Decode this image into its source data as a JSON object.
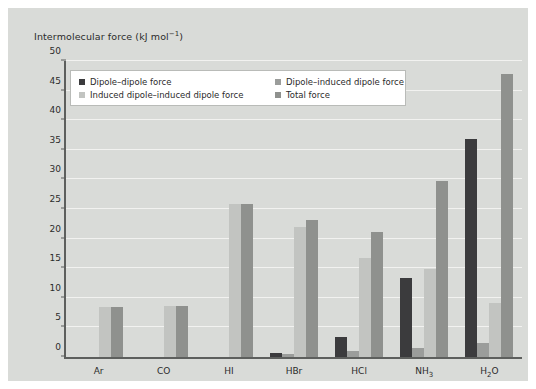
{
  "figure": {
    "background": "#d9dbd8",
    "page_background": "#ffffff",
    "axis_color": "#5d5f5d",
    "grid_color": "#f2f2f0"
  },
  "chart_data": {
    "type": "bar",
    "title": "",
    "ylabel": "Intermolecular force (kJ mol⁻¹)",
    "ylabel_parts": {
      "text": "Intermolecular force (kJ mol",
      "sup": "−1",
      "tail": ")"
    },
    "xlabel": "",
    "ylim": [
      0,
      50
    ],
    "yticks": [
      0,
      5,
      10,
      15,
      20,
      25,
      30,
      35,
      40,
      45,
      50
    ],
    "ytick_labels": [
      "0",
      "5",
      "10",
      "15",
      "20",
      "25",
      "30",
      "35",
      "40",
      "45",
      "50"
    ],
    "grid": true,
    "legend_position": "upper-left-inside",
    "categories": [
      "Ar",
      "CO",
      "HI",
      "HBr",
      "HCl",
      "NH3",
      "H2O"
    ],
    "category_labels": [
      {
        "base": "Ar",
        "sub": ""
      },
      {
        "base": "CO",
        "sub": ""
      },
      {
        "base": "HI",
        "sub": ""
      },
      {
        "base": "HBr",
        "sub": ""
      },
      {
        "base": "HCl",
        "sub": ""
      },
      {
        "base": "NH",
        "sub": "3"
      },
      {
        "base": "H",
        "sub": "2",
        "tail": "O"
      }
    ],
    "series": [
      {
        "name": "Dipole–dipole force",
        "color": "#3b3b3d",
        "values": [
          0,
          0,
          0,
          0.7,
          3.3,
          13.3,
          36.8
        ]
      },
      {
        "name": "Dipole–induced dipole force",
        "color": "#9b9d9b",
        "values": [
          0,
          0,
          0,
          0.5,
          1.0,
          1.5,
          2.3
        ]
      },
      {
        "name": "Induced dipole–induced dipole force",
        "color": "#c2c4c1",
        "values": [
          8.4,
          8.6,
          25.9,
          21.9,
          16.8,
          14.9,
          9.2
        ]
      },
      {
        "name": "Total force",
        "color": "#8f918e",
        "values": [
          8.4,
          8.6,
          25.9,
          23.1,
          21.2,
          29.7,
          47.8
        ]
      }
    ]
  }
}
